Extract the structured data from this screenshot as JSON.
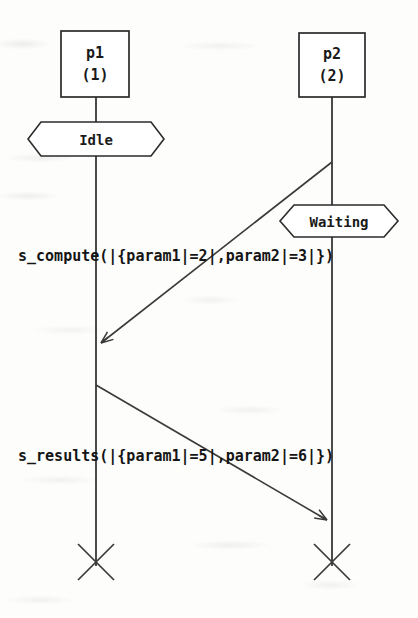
{
  "diagram": {
    "type": "uml-sequence-diagram",
    "width": 418,
    "height": 618,
    "background_color": "#fdfdfc",
    "ink_color": "#2b2b2b",
    "lifelines": [
      {
        "id": "p1",
        "name": "p1",
        "index_label": "(1)",
        "x": 96,
        "box": {
          "x": 61,
          "y": 31,
          "width": 68,
          "height": 66
        },
        "terminates": true,
        "termination_y": 562
      },
      {
        "id": "p2",
        "name": "p2",
        "index_label": "(2)",
        "x": 332,
        "box": {
          "x": 299,
          "y": 33,
          "width": 66,
          "height": 64
        },
        "terminates": true,
        "termination_y": 562
      }
    ],
    "states": [
      {
        "label": "Idle",
        "lifeline": "p1",
        "cx": 96,
        "cy": 139,
        "width": 136,
        "height": 34
      },
      {
        "label": "Waiting",
        "lifeline": "p2",
        "cx": 339,
        "cy": 221,
        "width": 118,
        "height": 33
      }
    ],
    "messages": [
      {
        "label": "s_compute(|{param1|=2|,param2|=3|})",
        "from": "p2",
        "to": "p1",
        "from_x": 332,
        "from_y": 162,
        "to_x": 98,
        "to_y": 345,
        "direction": "right-to-left",
        "label_x": 18,
        "label_y": 261
      },
      {
        "label": "s_results(|{param1|=5|,param2|=6|})",
        "from": "p1",
        "to": "p2",
        "from_x": 96,
        "from_y": 385,
        "to_x": 330,
        "to_y": 522,
        "direction": "left-to-right",
        "label_x": 18,
        "label_y": 461
      }
    ]
  }
}
